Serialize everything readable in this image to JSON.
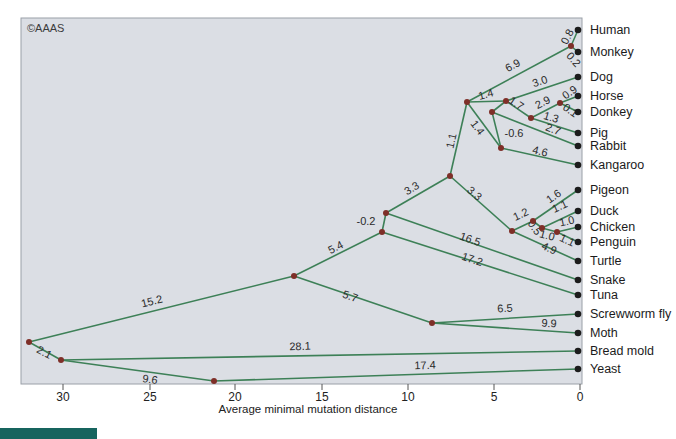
{
  "copyright": "©AAAS",
  "axis": {
    "label": "Average minimal mutation distance",
    "ticks": [
      {
        "label": "30",
        "x": 63
      },
      {
        "label": "25",
        "x": 150
      },
      {
        "label": "20",
        "x": 235
      },
      {
        "label": "15",
        "x": 322
      },
      {
        "label": "10",
        "x": 408
      },
      {
        "label": "5",
        "x": 494
      },
      {
        "label": "0",
        "x": 580
      }
    ]
  },
  "chart_data": {
    "type": "phylogenetic-tree",
    "xlabel": "Average minimal mutation distance",
    "x_axis_range_right_to_left": [
      0,
      30
    ],
    "leaf_x": 578,
    "label_x": 590,
    "species": [
      {
        "name": "Human",
        "y": 30,
        "branch_length": 0.8
      },
      {
        "name": "Monkey",
        "y": 52,
        "branch_length": 0.2
      },
      {
        "name": "Dog",
        "y": 77,
        "branch_length": 3.0
      },
      {
        "name": "Horse",
        "y": 96,
        "branch_length": 0.9
      },
      {
        "name": "Donkey",
        "y": 112,
        "branch_length": 0.1
      },
      {
        "name": "Pig",
        "y": 133,
        "branch_length": 1.3
      },
      {
        "name": "Rabbit",
        "y": 146,
        "branch_length": 2.7
      },
      {
        "name": "Kangaroo",
        "y": 165,
        "branch_length": 4.6
      },
      {
        "name": "Pigeon",
        "y": 190,
        "branch_length": 1.6
      },
      {
        "name": "Duck",
        "y": 211,
        "branch_length": 1.1
      },
      {
        "name": "Chicken",
        "y": 227,
        "branch_length": 1.0
      },
      {
        "name": "Penguin",
        "y": 242,
        "branch_length": 1.1
      },
      {
        "name": "Turtle",
        "y": 261,
        "branch_length": 4.9
      },
      {
        "name": "Snake",
        "y": 280,
        "branch_length": 16.5
      },
      {
        "name": "Tuna",
        "y": 295,
        "branch_length": 17.2
      },
      {
        "name": "Screwworm fly",
        "y": 314,
        "branch_length": 6.5
      },
      {
        "name": "Moth",
        "y": 333,
        "branch_length": 9.9
      },
      {
        "name": "Bread mold",
        "y": 351,
        "branch_length": 28.1
      },
      {
        "name": "Yeast",
        "y": 369,
        "branch_length": 17.4
      }
    ],
    "internal_nodes": [
      [
        29,
        342
      ],
      [
        61,
        360
      ],
      [
        214,
        381
      ],
      [
        294,
        276
      ],
      [
        382,
        232
      ],
      [
        386,
        213
      ],
      [
        450,
        176
      ],
      [
        467,
        102
      ],
      [
        571,
        46
      ],
      [
        506,
        101
      ],
      [
        492,
        112
      ],
      [
        531,
        118
      ],
      [
        560,
        103
      ],
      [
        501,
        148
      ],
      [
        432,
        323
      ],
      [
        512,
        231
      ],
      [
        533,
        221
      ],
      [
        542,
        228
      ],
      [
        557,
        232
      ]
    ],
    "edges": [
      {
        "from": [
          29,
          342
        ],
        "to": [
          294,
          276
        ],
        "label": "15.2",
        "lx": 152,
        "ly": 302,
        "rot": -14
      },
      {
        "from": [
          29,
          342
        ],
        "to": [
          61,
          360
        ],
        "label": "2.1",
        "lx": 44,
        "ly": 353,
        "rot": 28
      },
      {
        "from": [
          61,
          360
        ],
        "to": [
          578,
          351
        ],
        "label": "28.1",
        "lx": 300,
        "ly": 347,
        "rot": -2
      },
      {
        "from": [
          61,
          360
        ],
        "to": [
          214,
          381
        ],
        "label": "9.6",
        "lx": 150,
        "ly": 380,
        "rot": 8
      },
      {
        "from": [
          214,
          381
        ],
        "to": [
          578,
          369
        ],
        "label": "17.4",
        "lx": 425,
        "ly": 366,
        "rot": -2
      },
      {
        "from": [
          294,
          276
        ],
        "to": [
          382,
          232
        ],
        "label": "5.4",
        "lx": 336,
        "ly": 248,
        "rot": -27
      },
      {
        "from": [
          294,
          276
        ],
        "to": [
          432,
          323
        ],
        "label": "5.7",
        "lx": 350,
        "ly": 297,
        "rot": 19
      },
      {
        "from": [
          432,
          323
        ],
        "to": [
          578,
          314
        ],
        "label": "6.5",
        "lx": 505,
        "ly": 309,
        "rot": -4
      },
      {
        "from": [
          432,
          323
        ],
        "to": [
          578,
          333
        ],
        "label": "9.9",
        "lx": 549,
        "ly": 324,
        "rot": 4
      },
      {
        "from": [
          382,
          232
        ],
        "to": [
          386,
          213
        ],
        "label": "-0.2",
        "lx": 366,
        "ly": 222,
        "rot": 0
      },
      {
        "from": [
          382,
          232
        ],
        "to": [
          578,
          295
        ],
        "label": "17.2",
        "lx": 472,
        "ly": 260,
        "rot": 18
      },
      {
        "from": [
          386,
          213
        ],
        "to": [
          450,
          176
        ],
        "label": "3.3",
        "lx": 412,
        "ly": 189,
        "rot": -30
      },
      {
        "from": [
          386,
          213
        ],
        "to": [
          578,
          280
        ],
        "label": "16.5",
        "lx": 470,
        "ly": 240,
        "rot": 19
      },
      {
        "from": [
          450,
          176
        ],
        "to": [
          467,
          102
        ],
        "label": "1.1",
        "lx": 452,
        "ly": 141,
        "rot": -77
      },
      {
        "from": [
          450,
          176
        ],
        "to": [
          512,
          231
        ],
        "label": "3.3",
        "lx": 474,
        "ly": 194,
        "rot": 41
      },
      {
        "from": [
          467,
          102
        ],
        "to": [
          571,
          46
        ],
        "label": "6.9",
        "lx": 513,
        "ly": 66,
        "rot": -28
      },
      {
        "from": [
          571,
          46
        ],
        "to": [
          578,
          30
        ],
        "label": "0.8",
        "lx": 568,
        "ly": 37,
        "rot": -62
      },
      {
        "from": [
          571,
          46
        ],
        "to": [
          578,
          52
        ],
        "label": "0.2",
        "lx": 573,
        "ly": 60,
        "rot": 48
      },
      {
        "from": [
          467,
          102
        ],
        "to": [
          506,
          101
        ],
        "label": "1.4",
        "lx": 486,
        "ly": 95,
        "rot": -15
      },
      {
        "from": [
          467,
          102
        ],
        "to": [
          501,
          148
        ],
        "label": "1.4",
        "lx": 477,
        "ly": 128,
        "rot": 53
      },
      {
        "from": [
          506,
          101
        ],
        "to": [
          492,
          112
        ],
        "label": "",
        "lx": 0,
        "ly": 0,
        "rot": 0
      },
      {
        "from": [
          506,
          101
        ],
        "to": [
          578,
          77
        ],
        "label": "3.0",
        "lx": 540,
        "ly": 82,
        "rot": -18
      },
      {
        "from": [
          506,
          101
        ],
        "to": [
          531,
          118
        ],
        "label": "1.7",
        "lx": 516,
        "ly": 104,
        "rot": 34
      },
      {
        "from": [
          531,
          118
        ],
        "to": [
          560,
          103
        ],
        "label": "2.9",
        "lx": 543,
        "ly": 103,
        "rot": -27
      },
      {
        "from": [
          560,
          103
        ],
        "to": [
          578,
          96
        ],
        "label": "0.9",
        "lx": 570,
        "ly": 93,
        "rot": -35
      },
      {
        "from": [
          560,
          103
        ],
        "to": [
          578,
          112
        ],
        "label": "0.1",
        "lx": 570,
        "ly": 111,
        "rot": 35
      },
      {
        "from": [
          531,
          118
        ],
        "to": [
          578,
          133
        ],
        "label": "1.3",
        "lx": 551,
        "ly": 118,
        "rot": 17
      },
      {
        "from": [
          492,
          112
        ],
        "to": [
          578,
          146
        ],
        "label": "2.7",
        "lx": 553,
        "ly": 130,
        "rot": 21
      },
      {
        "from": [
          492,
          112
        ],
        "to": [
          501,
          148
        ],
        "label": "-0.6",
        "lx": 514,
        "ly": 134,
        "rot": 0
      },
      {
        "from": [
          501,
          148
        ],
        "to": [
          578,
          165
        ],
        "label": "4.6",
        "lx": 540,
        "ly": 152,
        "rot": 14
      },
      {
        "from": [
          512,
          231
        ],
        "to": [
          533,
          221
        ],
        "label": "1.2",
        "lx": 521,
        "ly": 215,
        "rot": -25
      },
      {
        "from": [
          533,
          221
        ],
        "to": [
          578,
          190
        ],
        "label": "1.6",
        "lx": 554,
        "ly": 197,
        "rot": -35
      },
      {
        "from": [
          533,
          221
        ],
        "to": [
          542,
          228
        ],
        "label": "0.5",
        "lx": 534,
        "ly": 228,
        "rot": 55
      },
      {
        "from": [
          542,
          228
        ],
        "to": [
          578,
          211
        ],
        "label": "1.1",
        "lx": 560,
        "ly": 207,
        "rot": -25
      },
      {
        "from": [
          542,
          228
        ],
        "to": [
          557,
          232
        ],
        "label": "1.0",
        "lx": 547,
        "ly": 236,
        "rot": 15
      },
      {
        "from": [
          557,
          232
        ],
        "to": [
          578,
          227
        ],
        "label": "1.0",
        "lx": 567,
        "ly": 222,
        "rot": -12
      },
      {
        "from": [
          557,
          232
        ],
        "to": [
          578,
          242
        ],
        "label": "1.1",
        "lx": 567,
        "ly": 241,
        "rot": 25
      },
      {
        "from": [
          512,
          231
        ],
        "to": [
          578,
          261
        ],
        "label": "4.9",
        "lx": 549,
        "ly": 249,
        "rot": 25
      }
    ]
  }
}
